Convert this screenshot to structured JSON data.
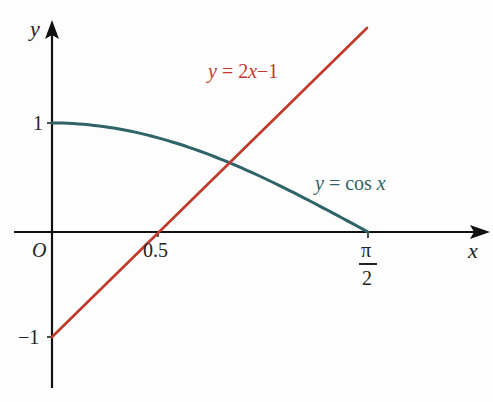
{
  "chart_data": {
    "type": "line",
    "title": "",
    "xlabel": "x",
    "ylabel": "y",
    "origin_label": "O",
    "x_ticks": [
      {
        "value": 0.5,
        "label": "0.5"
      },
      {
        "value": 1.5708,
        "label_num": "π",
        "label_den": "2"
      }
    ],
    "y_ticks": [
      {
        "value": 1,
        "label": "1"
      },
      {
        "value": -1,
        "label": "-1"
      }
    ],
    "xlim": [
      -0.15,
      1.9
    ],
    "ylim": [
      -1.4,
      2.0
    ],
    "grid": false,
    "series": [
      {
        "name": "y = cos x",
        "color": "#2e6367",
        "x": [
          0,
          0.2,
          0.4,
          0.6,
          0.8,
          1.0,
          1.2,
          1.4,
          1.5708
        ],
        "y": [
          1,
          0.98,
          0.921,
          0.825,
          0.697,
          0.54,
          0.362,
          0.17,
          0
        ]
      },
      {
        "name": "y = 2x−1",
        "color": "#c0392b",
        "x": [
          0,
          0.5,
          1.5
        ],
        "y": [
          -1,
          0,
          2
        ]
      }
    ],
    "annotations": [
      {
        "text": "y = 2x−1",
        "color": "#c0392b"
      },
      {
        "text": "y = cos x",
        "color": "#2e6367"
      }
    ]
  },
  "labels": {
    "y_axis": "y",
    "x_axis": "x",
    "origin": "O",
    "tick_one": "1",
    "tick_minus_one": "−1",
    "tick_half": "0.5",
    "tick_pi": "π",
    "tick_two": "2",
    "line_label_eq": "= 2",
    "line_label_x": "x",
    "line_label_rest": "−1",
    "cos_label_eq": "= cos ",
    "cos_label_x": "x",
    "y_var": "y"
  }
}
